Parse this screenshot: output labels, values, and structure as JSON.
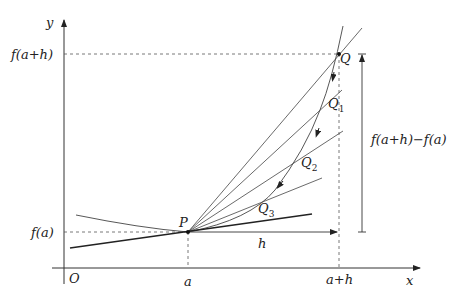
{
  "diagram": {
    "type": "secant-to-tangent",
    "axes": {
      "x_label": "x",
      "y_label": "y",
      "origin_label": "O"
    },
    "x_ticks": [
      {
        "label": "a"
      },
      {
        "label": "a+h"
      }
    ],
    "y_ticks": [
      {
        "label": "f(a)"
      },
      {
        "label": "f(a+h)"
      }
    ],
    "points": [
      {
        "label": "P"
      },
      {
        "label": "Q"
      },
      {
        "label": "Q",
        "sub": "1"
      },
      {
        "label": "Q",
        "sub": "2"
      },
      {
        "label": "Q",
        "sub": "3"
      }
    ],
    "increment_labels": {
      "horizontal": "h",
      "vertical": "f(a+h)−f(a)"
    },
    "colors": {
      "stroke": "#333333",
      "background": "#ffffff"
    }
  }
}
